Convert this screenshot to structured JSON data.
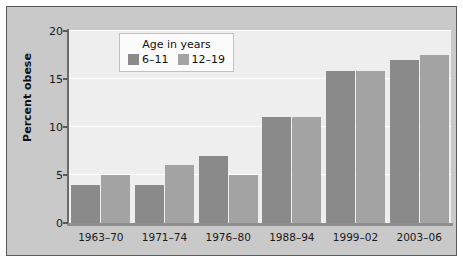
{
  "chart_data": {
    "type": "bar",
    "title": "",
    "xlabel": "",
    "ylabel": "Percent obese",
    "ylim": [
      0,
      20
    ],
    "yticks": [
      0,
      5,
      10,
      15,
      20
    ],
    "ytick_labels": [
      "0",
      "5",
      "10",
      "15",
      "20"
    ],
    "grid": true,
    "legend_position": "top-center",
    "legend_title": "Age in years",
    "categories": [
      "1963–70",
      "1971–74",
      "1976–80",
      "1988–94",
      "1999–02",
      "2003–06"
    ],
    "series": [
      {
        "name": "6–11",
        "color": "#8a8a8a",
        "values": [
          4.0,
          4.0,
          7.0,
          11.0,
          15.8,
          17.0
        ]
      },
      {
        "name": "12–19",
        "color": "#a3a3a3",
        "values": [
          5.0,
          6.0,
          5.0,
          11.0,
          15.8,
          17.5
        ]
      }
    ]
  },
  "style": {
    "panel_background": "#c9c9c9",
    "plot_background": "#eeeeee",
    "gridline_color": "#ffffff",
    "axis_color": "#6a6a6a"
  }
}
